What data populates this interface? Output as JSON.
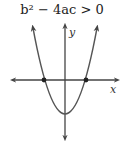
{
  "diagram": {
    "title": "b² − 4ac > 0",
    "x_axis_label": "x",
    "y_axis_label": "y",
    "roots_count": 2,
    "colors": {
      "stroke": "#444444",
      "background": "#ffffff"
    }
  }
}
